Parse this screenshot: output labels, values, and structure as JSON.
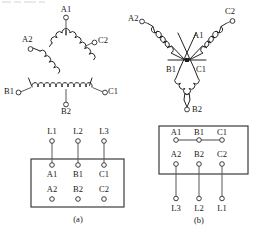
{
  "figure": {
    "width": 257,
    "height": 229,
    "background": "#ffffff",
    "ink_color": "#1c1c1c",
    "wire_color": "#555a5e"
  },
  "panels": [
    {
      "id": "a",
      "caption": "(a)",
      "connection_type": "delta",
      "winding_diagram": {
        "name": "delta-winding",
        "shape": "triangle",
        "terminals": [
          {
            "label": "A1",
            "position": "top-apex-lead"
          },
          {
            "label": "A2",
            "position": "upper-left"
          },
          {
            "label": "C2",
            "position": "upper-right"
          },
          {
            "label": "B1",
            "position": "bottom-left"
          },
          {
            "label": "C1",
            "position": "bottom-right"
          },
          {
            "label": "B2",
            "position": "bottom-center-lead"
          }
        ],
        "coils": [
          {
            "name": "coil-a",
            "from": "A2",
            "to": "A1"
          },
          {
            "name": "coil-c",
            "from": "A1",
            "to": "C2"
          },
          {
            "name": "coil-b",
            "from": "B1",
            "to": "C1"
          }
        ]
      },
      "terminal_block": {
        "name": "terminal-block-delta",
        "supply_labels": [
          "L1",
          "L2",
          "L3"
        ],
        "supply_position": "above",
        "rows": [
          {
            "name": "row-top",
            "cells": [
              "A1",
              "B1",
              "C1"
            ]
          },
          {
            "name": "row-bottom",
            "cells": [
              "A2",
              "B2",
              "C2"
            ]
          }
        ],
        "links": [],
        "supply_connections": [
          {
            "from": "L1",
            "to": "A1"
          },
          {
            "from": "L2",
            "to": "B1"
          },
          {
            "from": "L3",
            "to": "C1"
          }
        ]
      }
    },
    {
      "id": "b",
      "caption": "(b)",
      "connection_type": "star",
      "winding_diagram": {
        "name": "star-winding",
        "shape": "wye",
        "star_point": "common-node",
        "terminals": [
          {
            "label": "A2",
            "position": "upper-left"
          },
          {
            "label": "C2",
            "position": "upper-right"
          },
          {
            "label": "B2",
            "position": "bottom"
          },
          {
            "label": "A1",
            "position": "center-upper"
          },
          {
            "label": "B1",
            "position": "center-left"
          },
          {
            "label": "C1",
            "position": "center-right"
          }
        ],
        "coils": [
          {
            "name": "coil-a",
            "from": "A2",
            "to": "A1"
          },
          {
            "name": "coil-c",
            "from": "C2",
            "to": "C1"
          },
          {
            "name": "coil-b",
            "from": "B1",
            "to": "B2"
          }
        ]
      },
      "terminal_block": {
        "name": "terminal-block-star",
        "supply_labels": [
          "L3",
          "L2",
          "L1"
        ],
        "supply_position": "below",
        "rows": [
          {
            "name": "row-top",
            "cells": [
              "A1",
              "B1",
              "C1"
            ]
          },
          {
            "name": "row-bottom",
            "cells": [
              "A2",
              "B2",
              "C2"
            ]
          }
        ],
        "links": [
          {
            "name": "link-bar-top",
            "from": "A1",
            "to": "C1",
            "spans": [
              "A1",
              "B1",
              "C1"
            ]
          }
        ],
        "supply_connections": [
          {
            "from": "L3",
            "to": "A2"
          },
          {
            "from": "L2",
            "to": "B2"
          },
          {
            "from": "L1",
            "to": "C2"
          }
        ]
      }
    }
  ]
}
